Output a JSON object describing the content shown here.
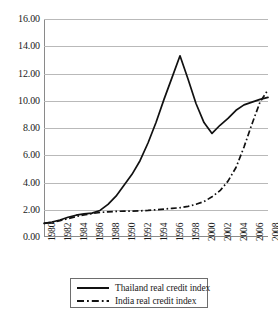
{
  "chart_data": {
    "type": "line",
    "title": "",
    "subtitle": "",
    "xlabel": "",
    "ylabel": "",
    "grid": true,
    "legend_position": "bottom-center",
    "xlim": [
      1980,
      2008
    ],
    "ylim": [
      0.0,
      16.0
    ],
    "x_tick_labels": [
      "1980",
      "1982",
      "1984",
      "1986",
      "1988",
      "1990",
      "1992",
      "1994",
      "1996",
      "1998",
      "2000",
      "2002",
      "2004",
      "2006",
      "2008"
    ],
    "y_tick_labels": [
      "0.00",
      "2.00",
      "4.00",
      "6.00",
      "8.00",
      "10.00",
      "12.00",
      "14.00",
      "16.00"
    ],
    "y_ticks": [
      0,
      2,
      4,
      6,
      8,
      10,
      12,
      14,
      16
    ],
    "x": [
      1980,
      1981,
      1982,
      1983,
      1984,
      1985,
      1986,
      1987,
      1988,
      1989,
      1990,
      1991,
      1992,
      1993,
      1994,
      1995,
      1996,
      1997,
      1998,
      1999,
      2000,
      2001,
      2002,
      2003,
      2004,
      2005,
      2006,
      2007,
      2008
    ],
    "series": [
      {
        "name": "Thailand real credit index",
        "style": "solid",
        "color": "#111111",
        "values": [
          1.0,
          1.1,
          1.25,
          1.45,
          1.6,
          1.7,
          1.75,
          1.95,
          2.4,
          3.0,
          3.8,
          4.6,
          5.6,
          6.9,
          8.4,
          10.1,
          11.7,
          13.3,
          11.6,
          9.8,
          8.4,
          7.6,
          8.2,
          8.7,
          9.3,
          9.7,
          9.9,
          10.1,
          10.25
        ]
      },
      {
        "name": "India real credit index",
        "style": "dash-dot",
        "color": "#111111",
        "values": [
          1.0,
          1.08,
          1.2,
          1.35,
          1.5,
          1.62,
          1.72,
          1.8,
          1.85,
          1.88,
          1.9,
          1.9,
          1.92,
          1.95,
          2.0,
          2.05,
          2.1,
          2.15,
          2.25,
          2.4,
          2.6,
          2.95,
          3.4,
          4.1,
          5.1,
          6.6,
          8.3,
          9.9,
          10.8
        ]
      }
    ],
    "legend": [
      {
        "label": "Thailand real credit index",
        "style": "solid"
      },
      {
        "label": "India real credit index",
        "style": "dash-dot"
      }
    ]
  }
}
